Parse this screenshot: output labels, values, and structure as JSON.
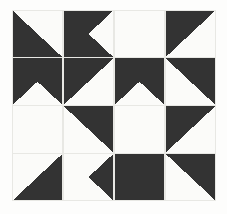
{
  "artwork": {
    "title": "Pinwheel Quilt Block Pattern",
    "description": "Four-by-four grid of square tiles forming four rotational pinwheel blocks",
    "canvas": {
      "width": 227,
      "height": 214,
      "background_color": "#fdfdfc"
    },
    "frame": {
      "x": 12,
      "y": 10,
      "width": 204,
      "height": 191,
      "grid_line_color": "#e8e8e4",
      "grid_line_width": 1.1
    },
    "colors": {
      "dark": "#333333",
      "light": "#fbfbf9",
      "outer_background": "#fdfdfc",
      "grid_line": "#e8e8e4"
    },
    "grid": {
      "columns": 4,
      "rows": 4,
      "cell_width": 51,
      "cell_height": 47.75
    },
    "blocks": [
      {
        "name": "block-top-left",
        "block_row": 0,
        "block_col": 0,
        "center_x": 102,
        "center_y": 95.5
      },
      {
        "name": "block-top-right",
        "block_row": 0,
        "block_col": 1,
        "center_x": 102,
        "center_y": 95.5
      },
      {
        "name": "block-bottom-left",
        "block_row": 1,
        "block_col": 0,
        "center_x": 102,
        "center_y": 95.5
      },
      {
        "name": "block-bottom-right",
        "block_row": 1,
        "block_col": 1,
        "center_x": 102,
        "center_y": 95.5
      }
    ],
    "cells": [
      {
        "row": 0,
        "col": 0,
        "base": "dark",
        "spike": "light",
        "spike_base_edge": "top",
        "apex_corner": "bottom-right"
      },
      {
        "row": 0,
        "col": 1,
        "base": "light",
        "spike": "dark",
        "spike_base_edge": "top",
        "apex_corner": "bottom-left"
      },
      {
        "row": 0,
        "col": 2,
        "base": "dark",
        "spike": "light",
        "spike_base_edge": "top",
        "apex_corner": "bottom-right"
      },
      {
        "row": 0,
        "col": 3,
        "base": "light",
        "spike": "dark",
        "spike_base_edge": "top",
        "apex_corner": "bottom-left"
      },
      {
        "row": 1,
        "col": 0,
        "base": "light",
        "spike": "dark",
        "spike_base_edge": "left",
        "apex_corner": "top-right"
      },
      {
        "row": 1,
        "col": 1,
        "base": "dark",
        "spike": "light",
        "spike_base_edge": "bottom",
        "apex_corner": "top-right"
      },
      {
        "row": 1,
        "col": 2,
        "base": "light",
        "spike": "dark",
        "spike_base_edge": "right",
        "apex_corner": "top-left"
      },
      {
        "row": 1,
        "col": 3,
        "base": "dark",
        "spike": "light",
        "spike_base_edge": "bottom",
        "apex_corner": "top-left"
      },
      {
        "row": 2,
        "col": 0,
        "base": "dark",
        "spike": "light",
        "spike_base_edge": "left",
        "apex_corner": "bottom-right"
      },
      {
        "row": 2,
        "col": 1,
        "base": "light",
        "spike": "dark",
        "spike_base_edge": "top",
        "apex_corner": "bottom-right"
      },
      {
        "row": 2,
        "col": 2,
        "base": "dark",
        "spike": "light",
        "spike_base_edge": "right",
        "apex_corner": "bottom-left"
      },
      {
        "row": 2,
        "col": 3,
        "base": "light",
        "spike": "dark",
        "spike_base_edge": "top",
        "apex_corner": "bottom-left"
      },
      {
        "row": 3,
        "col": 0,
        "base": "light",
        "spike": "dark",
        "spike_base_edge": "bottom",
        "apex_corner": "top-right"
      },
      {
        "row": 3,
        "col": 1,
        "base": "dark",
        "spike": "light",
        "spike_base_edge": "bottom",
        "apex_corner": "top-left"
      },
      {
        "row": 3,
        "col": 2,
        "base": "light",
        "spike": "dark",
        "spike_base_edge": "bottom",
        "apex_corner": "top-right"
      },
      {
        "row": 3,
        "col": 3,
        "base": "dark",
        "spike": "light",
        "spike_base_edge": "bottom",
        "apex_corner": "top-left"
      }
    ]
  }
}
